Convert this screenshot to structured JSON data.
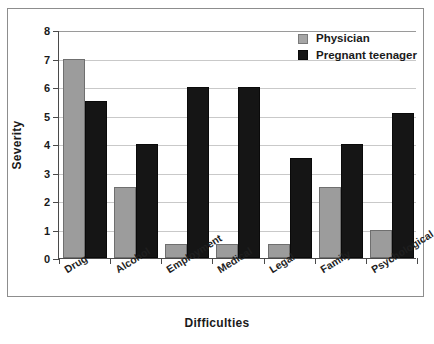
{
  "chart_data": {
    "type": "bar",
    "title": "",
    "xlabel": "Difficulties",
    "ylabel": "Severity",
    "ylim": [
      0,
      8
    ],
    "yticks": [
      0,
      1,
      2,
      3,
      4,
      5,
      6,
      7,
      8
    ],
    "grid": true,
    "legend_position": "top-right",
    "categories": [
      "Drug",
      "Alcohol",
      "Employment",
      "Medical",
      "Legal",
      "Family",
      "Psychological"
    ],
    "series": [
      {
        "name": "Physician",
        "color": "#9c9c9c",
        "values": [
          7,
          2.5,
          0.5,
          0.5,
          0.5,
          2.5,
          1
        ]
      },
      {
        "name": "Pregnant teenager",
        "color": "#151515",
        "values": [
          5.5,
          4,
          6,
          6,
          3.5,
          4,
          5.1
        ]
      }
    ]
  }
}
